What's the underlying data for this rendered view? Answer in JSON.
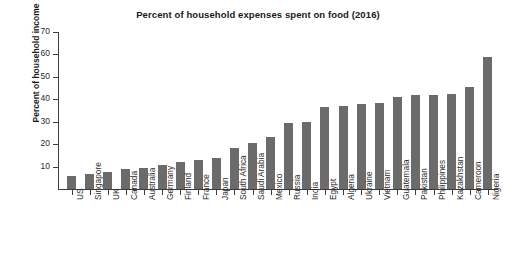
{
  "chart_data": {
    "type": "bar",
    "title": "Percent of household expenses spent on food (2016)",
    "xlabel": "",
    "ylabel": "Percent of household income",
    "ylim": [
      0,
      70
    ],
    "yticks": [
      10,
      20,
      30,
      40,
      50,
      60,
      70
    ],
    "grid": false,
    "legend": null,
    "bar_color": "#6b6b6b",
    "axis_color": "#3d3d3d",
    "categories": [
      "US",
      "Singapore",
      "UK",
      "Canada",
      "Australia",
      "Germany",
      "Finland",
      "France",
      "Japan",
      "South Africa",
      "Saudi Arabia",
      "Mexico",
      "Russia",
      "India",
      "Egypt",
      "Algeria",
      "Ukraine",
      "Vietnam",
      "Guatemala",
      "Pakistan",
      "Philippines",
      "Kazakhstan",
      "Cameroon",
      "Nigeria"
    ],
    "values": [
      6,
      6.5,
      7.5,
      9,
      9.5,
      10.5,
      12,
      13,
      14,
      18.5,
      20.5,
      23,
      29.5,
      30,
      36.5,
      37,
      38,
      38.5,
      41,
      42,
      42,
      42.5,
      45.5,
      59
    ]
  }
}
